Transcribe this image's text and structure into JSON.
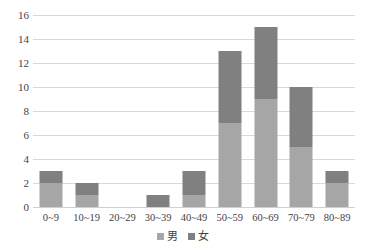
{
  "chart_data": {
    "type": "bar",
    "subtype": "stacked-vertical",
    "title": "",
    "subtitle": "",
    "xlabel": "",
    "ylabel": "",
    "categories": [
      "0~9",
      "10~19",
      "20~29",
      "30~39",
      "40~49",
      "50~59",
      "60~69",
      "70~79",
      "80~89"
    ],
    "series": [
      {
        "name": "男",
        "color": "#a6a6a6",
        "values": [
          2,
          1,
          0,
          0,
          1,
          7,
          9,
          5,
          2
        ]
      },
      {
        "name": "女",
        "color": "#808080",
        "values": [
          1,
          1,
          0,
          1,
          2,
          6,
          6,
          5,
          1
        ]
      }
    ],
    "totals": [
      3,
      2,
      0,
      1,
      3,
      13,
      15,
      10,
      3
    ],
    "ylim": [
      0,
      16
    ],
    "ytick_step": 2,
    "yticks": [
      "16",
      "14",
      "12",
      "10",
      "8",
      "6",
      "4",
      "2",
      "0"
    ],
    "ytick_values": [
      16,
      14,
      12,
      10,
      8,
      6,
      4,
      2,
      0
    ],
    "grid": true,
    "grid_axis": "y",
    "legend": true,
    "legend_position": "bottom",
    "legend_entries": [
      {
        "label": "男",
        "color": "#a6a6a6"
      },
      {
        "label": "女",
        "color": "#808080"
      }
    ],
    "background_color": "#ffffff",
    "gridline_color": "#d9d9d9",
    "text_color": "#3f3f3f"
  }
}
